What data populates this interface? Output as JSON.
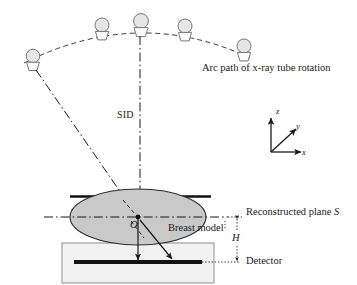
{
  "figure": {
    "background_color": "#ffffff",
    "line_color": "#1a1a1a",
    "breast_fill": "#c9c9c9",
    "detector_box_fill": "#f0f0f0",
    "detector_bar_color": "#151515",
    "tube_fill": "#e8e8e8"
  },
  "labels": {
    "arc_path": "Arc path of x-ray tube rotation",
    "sid": "SID",
    "reconstructed_plane": "Reconstructed plane ",
    "reconstructed_plane_symbol": "S",
    "breast_model": "Breast model",
    "detector": "Detector",
    "origin": "O",
    "height": "H"
  },
  "axes": {
    "z": "z",
    "y": "y",
    "x": "x"
  },
  "geometry": {
    "tubes": [
      {
        "cx": 33,
        "cy": 57,
        "r": 7.0,
        "name": "xray-tube-1"
      },
      {
        "cx": 102,
        "cy": 26,
        "r": 7.2,
        "name": "xray-tube-2"
      },
      {
        "cx": 141,
        "cy": 22,
        "r": 7.6,
        "name": "xray-tube-3"
      },
      {
        "cx": 185,
        "cy": 27,
        "r": 7.2,
        "name": "xray-tube-4"
      },
      {
        "cx": 245,
        "cy": 47,
        "r": 7.2,
        "name": "xray-tube-5"
      }
    ],
    "arc": {
      "start_x": 24,
      "start_y": 62,
      "apex_x": 140,
      "apex_y": 28,
      "end_x": 252,
      "end_y": 58
    },
    "origin_point": {
      "x": 138,
      "y": 217
    },
    "breast_ellipse": {
      "cx": 138,
      "cy": 217,
      "rx": 68,
      "ry": 28
    },
    "compression_plate": {
      "x1": 70,
      "y1": 197,
      "x2": 210,
      "y2": 197
    },
    "detector_box": {
      "x": 62,
      "y": 243,
      "width": 152,
      "height": 40
    },
    "detector_bar": {
      "x1": 74,
      "y1": 262,
      "x2": 202,
      "y2": 262
    },
    "recon_plane_line": {
      "y": 217,
      "x1": 44,
      "x2": 238
    },
    "axes_origin": {
      "x": 271,
      "y": 152
    }
  }
}
